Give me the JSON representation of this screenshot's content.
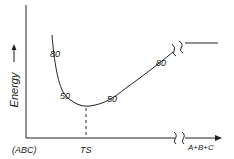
{
  "diagram": {
    "type": "energy-profile",
    "y_axis_label": "Energy",
    "x_axis_left_label": "(ABC)",
    "x_axis_right_label": "A+B+C",
    "transition_state_label": "TS",
    "curve_labels": [
      {
        "text": "80",
        "position": "left-upper"
      },
      {
        "text": "50",
        "position": "left-lower"
      },
      {
        "text": "50",
        "position": "right-lower"
      },
      {
        "text": "80",
        "position": "right-upper"
      }
    ],
    "line_color": "#222222",
    "background": "#ffffff"
  }
}
